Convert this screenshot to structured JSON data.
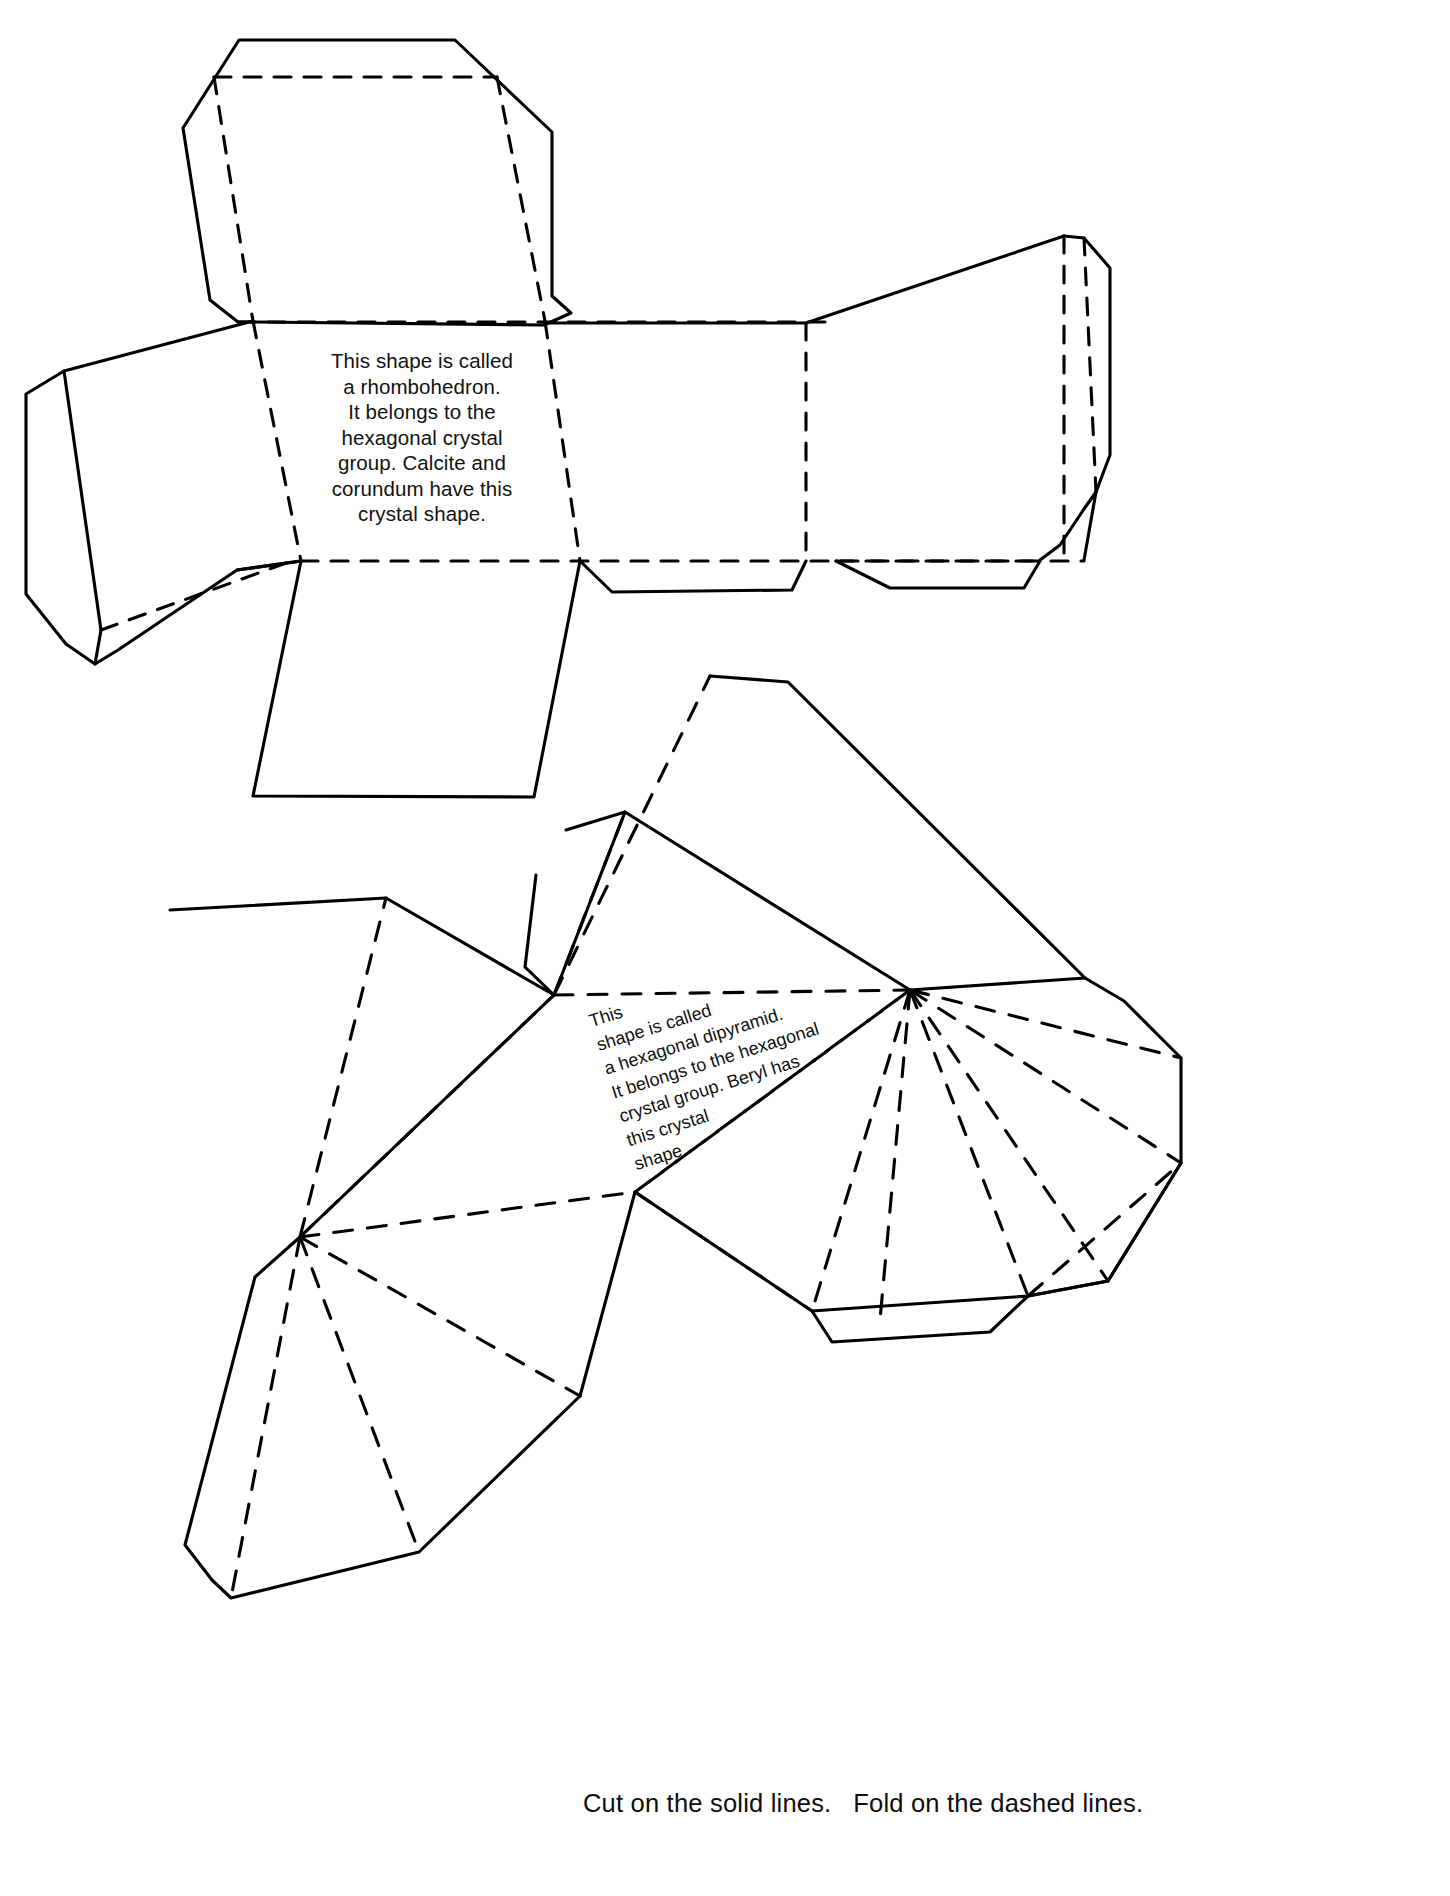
{
  "page": {
    "background_color": "#ffffff",
    "line_color": "#000000",
    "width": 1450,
    "height": 1896
  },
  "figures": [
    {
      "id": "rhombohedron-net",
      "name": "rhombohedron net",
      "label_text": "This shape is called\na rhombohedron.\nIt belongs to the\nhexagonal crystal\ngroup.  Calcite and\ncorundum have this\ncrystal shape.",
      "label_lines": [
        "This shape is called",
        "a rhombohedron.",
        "It belongs to the",
        "hexagonal crystal",
        "group.  Calcite and",
        "corundum have this",
        "crystal shape."
      ],
      "crystal_name": "rhombohedron",
      "crystal_group": "hexagonal",
      "minerals": [
        "Calcite",
        "corundum"
      ]
    },
    {
      "id": "dipyramid-net",
      "name": "hexagonal dipyramid net",
      "label_text": "This\nshape is called\na hexagonal dipyramid.\nIt belongs to the hexagonal\ncrystal group.  Beryl has\nthis crystal\nshape.",
      "label_lines": [
        "This",
        "shape is called",
        "a hexagonal dipyramid.",
        "It belongs to the hexagonal",
        "crystal group.  Beryl has",
        "this crystal",
        "shape."
      ],
      "crystal_name": "hexagonal dipyramid",
      "crystal_group": "hexagonal",
      "minerals": [
        "Beryl"
      ],
      "rotation_degrees": -17.5
    }
  ],
  "instructions": {
    "text": "Cut on the solid lines.   Fold on the dashed lines.",
    "cut_part": "Cut on the solid lines.",
    "fold_part": "Fold on the dashed lines."
  },
  "legend": {
    "solid_line_meaning": "cut",
    "dashed_line_meaning": "fold"
  }
}
